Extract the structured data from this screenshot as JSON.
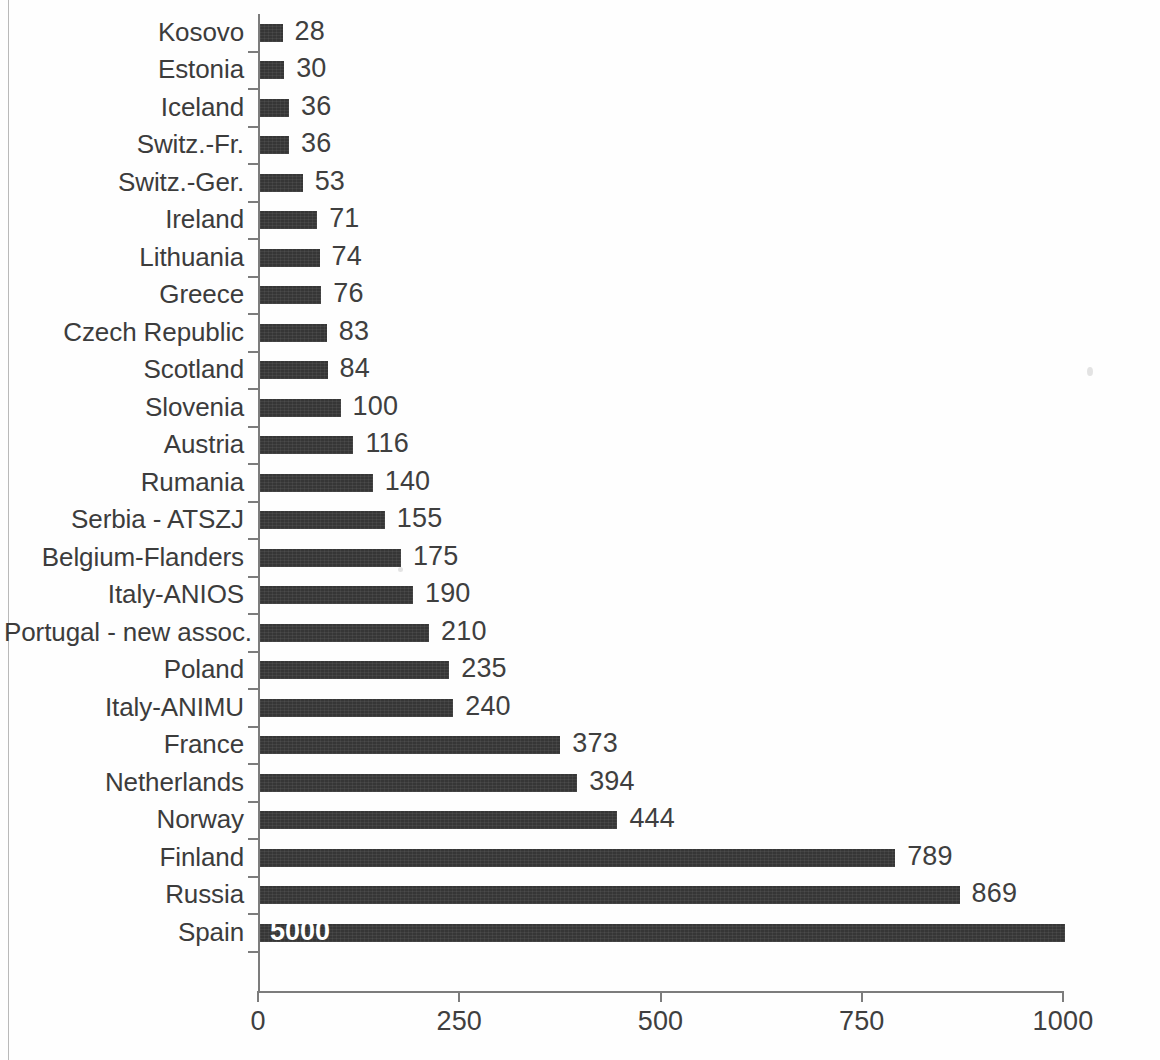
{
  "chart_data": {
    "type": "bar",
    "orientation": "horizontal",
    "title": "",
    "subtitle": "",
    "xlabel": "",
    "ylabel": "",
    "xlim": [
      0,
      1000
    ],
    "xticks": [
      "0",
      "250",
      "500",
      "750",
      "1000"
    ],
    "xtick_values": [
      0,
      250,
      500,
      750,
      1000
    ],
    "grid": false,
    "legend": null,
    "bar_color": "#363636",
    "axis_color": "#7c7c7c",
    "text_color": "#3c3c3c",
    "value_label_color": "#3f3f3f",
    "inside_label_color": "#ffffff",
    "note": "Top bar 'Spain' is clipped at the axis maximum; its true value 5000 is printed in white inside the bar.",
    "categories": [
      "Kosovo",
      "Estonia",
      "Iceland",
      "Switz.-Fr.",
      "Switz.-Ger.",
      "Ireland",
      "Lithuania",
      "Greece",
      "Czech Republic",
      "Scotland",
      "Slovenia",
      "Austria",
      "Rumania",
      "Serbia - ATSZJ",
      "Belgium-Flanders",
      "Italy-ANIOS",
      "Portugal - new assoc.",
      "Poland",
      "Italy-ANIMU",
      "France",
      "Netherlands",
      "Norway",
      "Finland",
      "Russia",
      "Spain"
    ],
    "values": [
      28,
      30,
      36,
      36,
      53,
      71,
      74,
      76,
      83,
      84,
      100,
      116,
      140,
      155,
      175,
      190,
      210,
      235,
      240,
      373,
      394,
      444,
      789,
      869,
      5000
    ],
    "value_labels": [
      "28",
      "30",
      "36",
      "36",
      "53",
      "71",
      "74",
      "76",
      "83",
      "84",
      "100",
      "116",
      "140",
      "155",
      "175",
      "190",
      "210",
      "235",
      "240",
      "373",
      "394",
      "444",
      "789",
      "869",
      "5000"
    ],
    "label_placement": [
      "outside",
      "outside",
      "outside",
      "outside",
      "outside",
      "outside",
      "outside",
      "outside",
      "outside",
      "outside",
      "outside",
      "outside",
      "outside",
      "outside",
      "outside",
      "outside",
      "outside",
      "outside",
      "outside",
      "outside",
      "outside",
      "outside",
      "outside",
      "outside",
      "inside"
    ]
  }
}
